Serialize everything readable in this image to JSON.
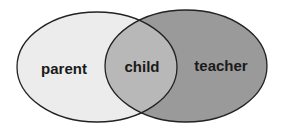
{
  "diagram": {
    "type": "venn",
    "sets": [
      {
        "id": "parent",
        "label": "parent",
        "fill": "#ececec"
      },
      {
        "id": "teacher",
        "label": "teacher",
        "fill": "#9a9a9a"
      }
    ],
    "intersection": {
      "label": "child",
      "fill": "#b8b8b8"
    },
    "stroke": "#222222"
  }
}
